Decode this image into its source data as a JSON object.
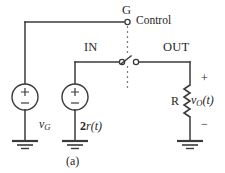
{
  "figure": {
    "caption": "(a)",
    "background": "#ffffff",
    "ink_color": "#3a3a3a",
    "dash_color": "#7b7b7b"
  },
  "labels": {
    "gate_node": "G",
    "control": "Control",
    "input_node": "IN",
    "output_node": "OUT",
    "resistor": "R",
    "output_voltage_v": "v",
    "output_voltage_sub": "O",
    "output_voltage_arg": "(t)",
    "gate_source_v": "v",
    "gate_source_sub": "G",
    "input_source_coef": "2",
    "input_source_r": "r",
    "input_source_arg": "(t)",
    "plus_sign": "+",
    "minus_sign": "−"
  },
  "elements": {
    "gate_source": {
      "name": "v_G",
      "polarity_top": "+",
      "polarity_bottom": "−"
    },
    "input_source": {
      "name": "2r(t)",
      "polarity_top": "+",
      "polarity_bottom": "−"
    },
    "resistor": {
      "name": "R",
      "voltage_label": "v_O(t)",
      "terminal_top": "+",
      "terminal_bottom": "−"
    },
    "switch": {
      "type": "spst-analog-switch",
      "state": "open",
      "left_terminal": "IN",
      "right_terminal": "OUT",
      "control_terminal": "G"
    },
    "grounds": [
      "gate-source-ground",
      "input-source-ground",
      "output-ground"
    ]
  }
}
